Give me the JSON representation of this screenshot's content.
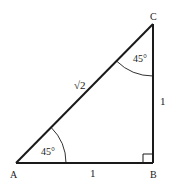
{
  "diagram": {
    "type": "right isosceles triangle",
    "vertices": {
      "A": {
        "label": "A"
      },
      "B": {
        "label": "B"
      },
      "C": {
        "label": "C"
      }
    },
    "angles": {
      "A": "45°",
      "C": "45°",
      "B": "right-angle"
    },
    "sides": {
      "AC": "√2",
      "AB": "1",
      "BC": "1"
    },
    "colors": {
      "stroke": "#1a1a1a",
      "background": "#ffffff"
    }
  }
}
